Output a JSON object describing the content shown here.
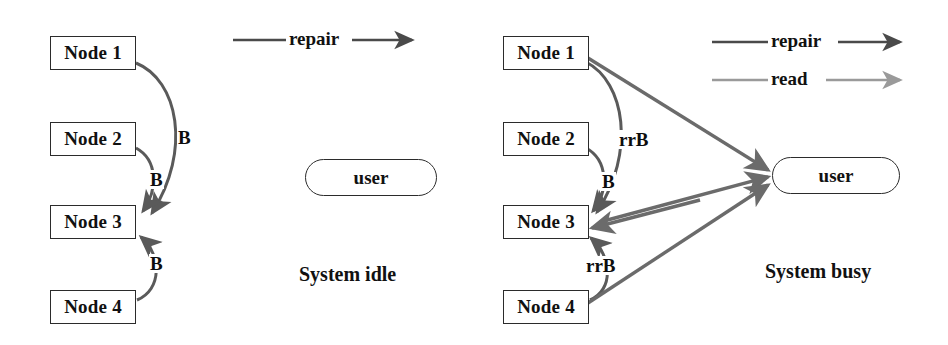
{
  "figure": {
    "width": 948,
    "height": 345,
    "background": "#ffffff"
  },
  "colors": {
    "node_stroke": "#2b2b2b",
    "text": "#111111",
    "repair_edge": "#4a4a4a",
    "read_edge": "#9a9a9a",
    "busy_edge": "#6b6b6b"
  },
  "panels": [
    {
      "id": "left",
      "caption": "System idle",
      "nodes": [
        {
          "label": "Node 1"
        },
        {
          "label": "Node 2"
        },
        {
          "label": "Node 3"
        },
        {
          "label": "Node 4"
        }
      ],
      "user": {
        "label": "user"
      },
      "edge_labels": [
        {
          "text": "B",
          "from": "Node 1",
          "to": "Node 3"
        },
        {
          "text": "B",
          "from": "Node 2",
          "to": "Node 3"
        },
        {
          "text": "B",
          "from": "Node 4",
          "to": "Node 3"
        }
      ],
      "legend": [
        {
          "label": "repair",
          "color": "#4a4a4a"
        }
      ]
    },
    {
      "id": "right",
      "caption": "System busy",
      "nodes": [
        {
          "label": "Node 1"
        },
        {
          "label": "Node 2"
        },
        {
          "label": "Node 3"
        },
        {
          "label": "Node 4"
        }
      ],
      "user": {
        "label": "user"
      },
      "edge_labels": [
        {
          "text": "rrB",
          "from": "Node 1",
          "to": "Node 3"
        },
        {
          "text": "B",
          "from": "Node 2",
          "to": "Node 3"
        },
        {
          "text": "rrB",
          "from": "Node 4",
          "to": "Node 3"
        }
      ],
      "read_edges": [
        {
          "from": "Node 1",
          "to": "user"
        },
        {
          "from": "Node 3",
          "to": "user"
        },
        {
          "from": "Node 4",
          "to": "user"
        }
      ],
      "legend": [
        {
          "label": "repair",
          "color": "#4a4a4a"
        },
        {
          "label": "read",
          "color": "#9a9a9a"
        }
      ]
    }
  ]
}
